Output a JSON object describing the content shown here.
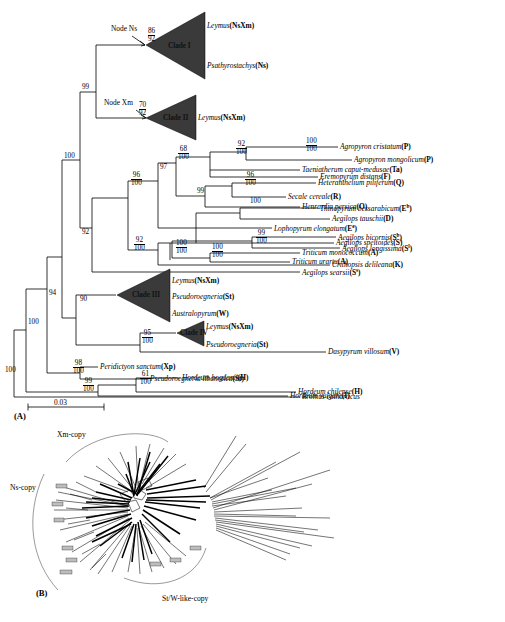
{
  "figure": {
    "panel_a_label": "(A)",
    "panel_b_label": "(B)",
    "scale_bar_value": "0.03"
  },
  "tree": {
    "node_labels": [
      {
        "id": "node-ns",
        "text": "Node Ns"
      },
      {
        "id": "node-xm",
        "text": "Node Xm"
      }
    ],
    "clades": [
      {
        "id": "clade-1",
        "name": "Clade I",
        "taxa": [
          "Leymus(NsXm)",
          "Psathyrostachys(Ns)"
        ]
      },
      {
        "id": "clade-2",
        "name": "Clade II",
        "taxa": [
          "Leymus(NsXm)"
        ]
      },
      {
        "id": "clade-3",
        "name": "Clade III",
        "taxa": [
          "Leymus(NsXm)",
          "Pseudoroegneria(St)",
          "Australopyrum(W)"
        ]
      },
      {
        "id": "clade-4",
        "name": "Clade IV",
        "taxa": [
          "Leymus(NsXm)",
          "Pseudoroegneria(St)"
        ]
      }
    ],
    "clade_taxa": {
      "c1_t1_name": "Leymus",
      "c1_t1_code": "(NsXm)",
      "c1_t2_name": "Psathyrostachys",
      "c1_t2_code": "(Ns)",
      "c2_t1_name": "Leymus",
      "c2_t1_code": "(NsXm)",
      "c3_t1_name": "Leymus",
      "c3_t1_code": "(NsXm)",
      "c3_t2_name": "Pseudoroegneria",
      "c3_t2_code": "(St)",
      "c3_t3_name": "Australopyrum",
      "c3_t3_code": "(W)",
      "c4_t1_name": "Leymus",
      "c4_t1_code": "(NsXm)",
      "c4_t2_name": "Pseudoroegneria",
      "c4_t2_code": "(St)"
    },
    "taxa": [
      {
        "id": "agropyron-cristatum",
        "name": "Agropyron cristatum",
        "genome": "P"
      },
      {
        "id": "agropyron-mongolicum",
        "name": "Agropyron mongolicum",
        "genome": "P"
      },
      {
        "id": "taeniatherum-caput-medusae",
        "name": "Taeniatherum caput-medusae",
        "genome": "Ta"
      },
      {
        "id": "eremopyrum-distans",
        "name": "Eremopyrum distans",
        "genome": "F"
      },
      {
        "id": "heteranthelium-piliferum",
        "name": "Heteranthelium piliferum",
        "genome": "Q"
      },
      {
        "id": "secale-cereale",
        "name": "Secale cereale",
        "genome": "R"
      },
      {
        "id": "henrardia-persica",
        "name": "Henrardia persica",
        "genome": "O"
      },
      {
        "id": "thinopyrum-bessarabicum",
        "name": "Thinopyrum bessarabicum",
        "genome": "E",
        "sup": "b"
      },
      {
        "id": "aegilops-tauschii",
        "name": "Aegilops tauschii",
        "genome": "D"
      },
      {
        "id": "lophopyrum-elongatum",
        "name": "Lophopyrum elongatum",
        "genome": "E",
        "sup": "e"
      },
      {
        "id": "aegilops-speltoides",
        "name": "Aegilops speltoides",
        "genome": "S"
      },
      {
        "id": "aegilops-bicornis",
        "name": "Aegilops bicornis",
        "genome": "S",
        "sup": "b"
      },
      {
        "id": "aegilops-longissima",
        "name": "Aegilops longissima",
        "genome": "S",
        "sup": "l"
      },
      {
        "id": "triticum-monococcum",
        "name": "Triticum monococcum",
        "genome": "A"
      },
      {
        "id": "triticum-urartu",
        "name": "Triticum urartu",
        "genome": "A"
      },
      {
        "id": "crithopsis-delileana",
        "name": "Crithopsis delileana",
        "genome": "K"
      },
      {
        "id": "aegilops-searsii",
        "name": "Aegilops searsii",
        "genome": "S",
        "sup": "s"
      },
      {
        "id": "dasypyrum-villosum",
        "name": "Dasypyrum villosum",
        "genome": "V"
      },
      {
        "id": "peridictyon-sanctum",
        "name": "Peridictyon sanctum",
        "genome": "Xp"
      },
      {
        "id": "pseudoroegneria-libanotica",
        "name": "Pseudoroegneria libanotica",
        "genome": "St"
      },
      {
        "id": "hordeum-bogdanii",
        "name": "Hordeum bogdanii",
        "genome": "H"
      },
      {
        "id": "hordeum-chilense",
        "name": "Hordeum chilense",
        "genome": "H"
      },
      {
        "id": "hordeum-vulgare",
        "name": "Hordeum vulgare",
        "genome": "I"
      },
      {
        "id": "bromus-catharticus",
        "name": "Bromus catharticus",
        "genome": ""
      }
    ],
    "support_values": [
      {
        "id": "sv-node-ns",
        "top": "86",
        "bottom": "92"
      },
      {
        "id": "sv-node-xm",
        "top": "70",
        "bottom": "92"
      },
      {
        "id": "sv-clade1-2",
        "top": "99",
        "bottom": ""
      },
      {
        "id": "sv-agropyron",
        "top": "100",
        "bottom": "100"
      },
      {
        "id": "sv-92-100-a",
        "top": "92",
        "bottom": "100"
      },
      {
        "id": "sv-68-100",
        "top": "68",
        "bottom": "100"
      },
      {
        "id": "sv-96-100-b",
        "top": "96",
        "bottom": "100"
      },
      {
        "id": "sv-99-b",
        "top": "99",
        "bottom": ""
      },
      {
        "id": "sv-100-thino",
        "top": "100",
        "bottom": ""
      },
      {
        "id": "sv-97",
        "top": "97",
        "bottom": ""
      },
      {
        "id": "sv-96-100-main",
        "top": "96",
        "bottom": "100"
      },
      {
        "id": "sv-99-100-bic",
        "top": "99",
        "bottom": "100"
      },
      {
        "id": "sv-92-100-trit",
        "top": "92",
        "bottom": "100"
      },
      {
        "id": "sv-100-100-trit",
        "top": "100",
        "bottom": "100"
      },
      {
        "id": "sv-100-100-mono",
        "top": "100",
        "bottom": "100"
      },
      {
        "id": "sv-92-left",
        "top": "92",
        "bottom": ""
      },
      {
        "id": "sv-100-upper",
        "top": "100",
        "bottom": ""
      },
      {
        "id": "sv-90-clade3",
        "top": "90",
        "bottom": ""
      },
      {
        "id": "sv-95-100-clade4",
        "top": "95",
        "bottom": "100"
      },
      {
        "id": "sv-100-mid",
        "top": "100",
        "bottom": ""
      },
      {
        "id": "sv-94",
        "top": "94",
        "bottom": ""
      },
      {
        "id": "sv-98-100",
        "top": "98",
        "bottom": "100"
      },
      {
        "id": "sv-99-100-hord",
        "top": "99",
        "bottom": "100"
      },
      {
        "id": "sv-61-100",
        "top": "61",
        "bottom": "100"
      },
      {
        "id": "sv-100-root",
        "top": "100",
        "bottom": ""
      }
    ]
  },
  "network": {
    "group_labels": [
      {
        "id": "xm-copy",
        "text": "Xm-copy"
      },
      {
        "id": "ns-copy",
        "text": "Ns-copy"
      },
      {
        "id": "stw-copy",
        "text": "St/W-like-copy"
      }
    ]
  }
}
